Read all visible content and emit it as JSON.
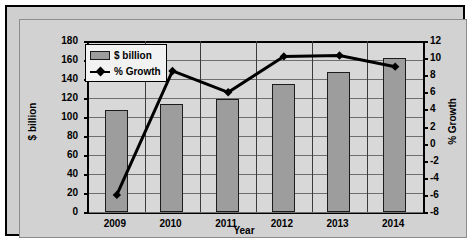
{
  "chart_data": {
    "type": "bar",
    "title": "",
    "xlabel": "Year",
    "categories": [
      "2009",
      "2010",
      "2011",
      "2012",
      "2013",
      "2014"
    ],
    "grid": true,
    "legend_position": "top-left-inside",
    "axes": {
      "left": {
        "label": "$ billion",
        "min": 0,
        "max": 180,
        "step": 20,
        "ticks": [
          "180",
          "160",
          "140",
          "120",
          "100",
          "80",
          "60",
          "40",
          "20",
          "0"
        ]
      },
      "right": {
        "label": "% Growth",
        "min": -8,
        "max": 12,
        "step": 2,
        "ticks": [
          "12",
          "10",
          "8",
          "6",
          "4",
          "2",
          "0",
          "-2",
          "-4",
          "-6",
          "-8"
        ]
      }
    },
    "series": [
      {
        "name": "$ billion",
        "type": "bar",
        "axis": "left",
        "color": "#9d9d9d",
        "values": [
          107,
          114,
          119,
          135,
          147,
          162
        ]
      },
      {
        "name": "% Growth",
        "type": "line",
        "axis": "right",
        "color": "#000000",
        "marker": "diamond",
        "values": [
          -6.0,
          8.5,
          6.0,
          10.2,
          10.3,
          9.0
        ]
      }
    ]
  },
  "legend": {
    "entries": [
      {
        "label": "$ billion"
      },
      {
        "label": "% Growth"
      }
    ]
  },
  "colors": {
    "bar_fill": "#9d9d9d",
    "bar_stroke": "#1c1c1c",
    "line": "#000000",
    "plot_bg": "#d8d8d8",
    "card_bg": "#d2d2d2",
    "frame": "#000000"
  }
}
